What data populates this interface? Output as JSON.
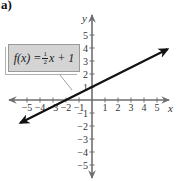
{
  "figure": {
    "part_label": "a)",
    "equation": {
      "lhs": "f(x) = ",
      "frac_num": "1",
      "frac_den": "2",
      "rhs": "x + 1"
    }
  },
  "colors": {
    "axis": "#6e6e6e",
    "line": "#111111",
    "box_fill": "#d4d4d4",
    "box_border": "#9a9a9a"
  },
  "chart_data": {
    "type": "line",
    "title": "",
    "function": "f(x) = (1/2)x + 1",
    "xlabel": "x",
    "ylabel": "y",
    "xlim": [
      -5.5,
      5.8
    ],
    "ylim": [
      -5.5,
      5.8
    ],
    "x_ticks": [
      -5,
      -4,
      -3,
      -2,
      -1,
      1,
      2,
      3,
      4,
      5
    ],
    "y_ticks": [
      5,
      4,
      3,
      2,
      1,
      -1,
      -2,
      -3,
      -4,
      -5
    ],
    "x_tick_labels": [
      "−5",
      "−4",
      "−3",
      "−2",
      "−1",
      "1",
      "2",
      "3",
      "4",
      "5"
    ],
    "y_tick_labels": [
      "5",
      "4",
      "3",
      "2",
      "1",
      "−1",
      "−2",
      "−3",
      "−4",
      "−5"
    ],
    "series": [
      {
        "name": "f(x) = 1/2 x + 1",
        "x": [
          -5.5,
          -4,
          -2,
          0,
          2,
          4,
          5.8
        ],
        "y": [
          -1.75,
          -1,
          0,
          1,
          2,
          3,
          3.9
        ]
      }
    ],
    "grid": false,
    "legend": "none",
    "annotations": [
      "Equation label box 'f(x) = 1/2 x + 1' with pointer line to the graph"
    ]
  }
}
